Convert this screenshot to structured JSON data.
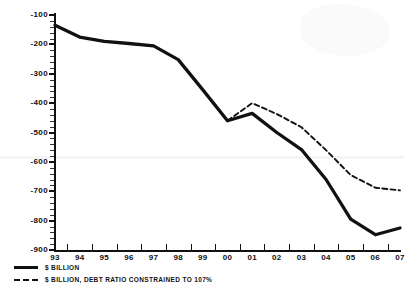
{
  "chart_data": {
    "type": "line",
    "title": "",
    "subtitle": "",
    "xlabel": "",
    "ylabel": "",
    "grid": false,
    "legend_position": "bottom-left",
    "categories": [
      "93",
      "94",
      "95",
      "96",
      "97",
      "98",
      "99",
      "00",
      "01",
      "02",
      "03",
      "04",
      "05",
      "06",
      "07"
    ],
    "x_tick_labels": [
      "93",
      "94",
      "95",
      "96",
      "97",
      "98",
      "99",
      "00",
      "01",
      "02",
      "03",
      "04",
      "05",
      "06",
      "07"
    ],
    "y_tick_labels": [
      "-100",
      "-200",
      "-300",
      "-400",
      "-500",
      "-600",
      "-700",
      "-800",
      "-900"
    ],
    "y_tick_values": [
      -100,
      -200,
      -300,
      -400,
      -500,
      -600,
      -700,
      -800,
      -900
    ],
    "ylim": [
      -900,
      -100
    ],
    "xlim": [
      "93",
      "07"
    ],
    "series": [
      {
        "name": "$ BILLION",
        "style": "solid",
        "color": "#111111",
        "x": [
          "93",
          "94",
          "95",
          "96",
          "97",
          "98",
          "99",
          "00",
          "01",
          "02",
          "03",
          "04",
          "05",
          "06",
          "07"
        ],
        "values": [
          -135,
          -175,
          -190,
          -197,
          -205,
          -252,
          -355,
          -460,
          -435,
          -500,
          -558,
          -660,
          -795,
          -848,
          -825
        ]
      },
      {
        "name": "$ BILLION, DEBT RATIO CONSTRAINED TO 107%",
        "style": "dashed",
        "color": "#111111",
        "x": [
          "00",
          "01",
          "02",
          "03",
          "04",
          "05",
          "06",
          "07"
        ],
        "values": [
          -460,
          -400,
          -437,
          -482,
          -560,
          -645,
          -688,
          -697
        ]
      }
    ]
  },
  "legend": {
    "items": [
      {
        "label": "$ BILLION",
        "style": "solid"
      },
      {
        "label": "$ BILLION, DEBT RATIO CONSTRAINED TO 107%",
        "style": "dashed"
      }
    ]
  }
}
